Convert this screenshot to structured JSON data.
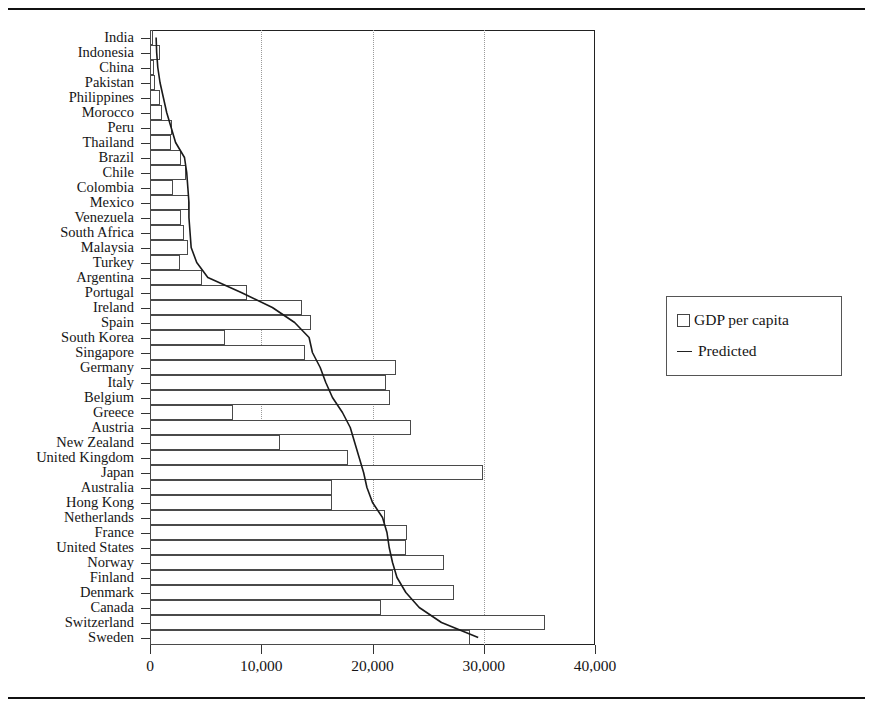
{
  "figure": {
    "legend": {
      "series_bar_label": "GDP per capita",
      "series_line_label": "Predicted"
    },
    "axis": {
      "x_tick_labels": [
        "0",
        "10,000",
        "20,000",
        "30,000",
        "40,000"
      ]
    }
  },
  "chart_data": {
    "type": "bar",
    "orientation": "horizontal",
    "title": "",
    "xlabel": "",
    "ylabel": "",
    "xlim": [
      0,
      40000
    ],
    "grid": "vertical dotted gridlines at 10,000 / 20,000 / 30,000",
    "legend_position": "right, outside plot area",
    "x_ticks": [
      0,
      10000,
      20000,
      30000,
      40000
    ],
    "categories": [
      "India",
      "Indonesia",
      "China",
      "Pakistan",
      "Philippines",
      "Morocco",
      "Peru",
      "Thailand",
      "Brazil",
      "Chile",
      "Colombia",
      "Mexico",
      "Venezuela",
      "South Africa",
      "Malaysia",
      "Turkey",
      "Argentina",
      "Portugal",
      "Ireland",
      "Spain",
      "South Korea",
      "Singapore",
      "Germany",
      "Italy",
      "Belgium",
      "Greece",
      "Austria",
      "New Zealand",
      "United Kingdom",
      "Japan",
      "Australia",
      "Hong Kong",
      "Netherlands",
      "France",
      "United States",
      "Norway",
      "Finland",
      "Denmark",
      "Canada",
      "Switzerland",
      "Sweden"
    ],
    "series": [
      {
        "name": "GDP per capita",
        "type": "bar",
        "values": [
          300,
          900,
          400,
          450,
          900,
          1100,
          2000,
          1900,
          2800,
          3200,
          2100,
          3500,
          2800,
          3100,
          3400,
          2700,
          4700,
          8700,
          13700,
          14500,
          6700,
          13900,
          22100,
          21200,
          21600,
          7500,
          23500,
          11700,
          17800,
          29900,
          16400,
          16400,
          21100,
          23100,
          23000,
          26400,
          21800,
          27300,
          20800,
          35500,
          28800
        ]
      },
      {
        "name": "Predicted",
        "type": "line",
        "values": [
          550,
          600,
          700,
          900,
          1200,
          1500,
          1900,
          2300,
          3100,
          3300,
          3400,
          3500,
          3500,
          3600,
          3700,
          4200,
          5200,
          8200,
          11000,
          13000,
          14300,
          14600,
          15300,
          15800,
          16400,
          17300,
          18000,
          18400,
          18800,
          19200,
          19500,
          20000,
          20900,
          21300,
          21500,
          21800,
          22200,
          23000,
          24200,
          26200,
          29500
        ]
      }
    ]
  }
}
